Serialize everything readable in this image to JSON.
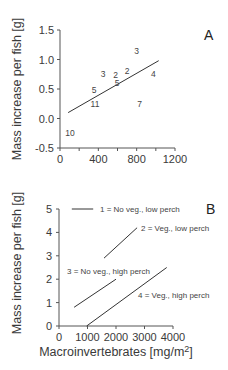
{
  "chart_data": [
    {
      "panel": "A",
      "type": "scatter",
      "title": "",
      "xlabel": "",
      "ylabel": "Mass increase per fish [g]",
      "xlim": [
        0,
        1200
      ],
      "ylim": [
        -0.5,
        1.5
      ],
      "xticks": [
        "0",
        "400",
        "800",
        "1200"
      ],
      "yticks": [
        "-0.5",
        "0.0",
        "0.5",
        "1.0",
        "1.5"
      ],
      "grid": false,
      "points": [
        {
          "label": "3",
          "x": 800,
          "y": 1.15
        },
        {
          "label": "3",
          "x": 450,
          "y": 0.76
        },
        {
          "label": "2",
          "x": 580,
          "y": 0.73
        },
        {
          "label": "2",
          "x": 700,
          "y": 0.81
        },
        {
          "label": "5",
          "x": 595,
          "y": 0.61
        },
        {
          "label": "4",
          "x": 975,
          "y": 0.76
        },
        {
          "label": "5",
          "x": 355,
          "y": 0.49
        },
        {
          "label": "11",
          "x": 365,
          "y": 0.25
        },
        {
          "label": "7",
          "x": 830,
          "y": 0.25
        },
        {
          "label": "10",
          "x": 105,
          "y": -0.25
        }
      ],
      "regression_line": {
        "x": [
          85,
          1030
        ],
        "y": [
          0.1,
          0.98
        ]
      }
    },
    {
      "panel": "B",
      "type": "line",
      "title": "",
      "xlabel": "Macroinvertebrates [mg/m²]",
      "ylabel": "Mass increase per fish [g]",
      "xlim": [
        0,
        4000
      ],
      "ylim": [
        0,
        5
      ],
      "xticks": [
        "0",
        "1000",
        "2000",
        "3000",
        "4000"
      ],
      "yticks": [
        "0",
        "1",
        "2",
        "3",
        "4",
        "5"
      ],
      "grid": false,
      "series": [
        {
          "name": "1 = No veg., low perch",
          "x": [
            450,
            1200
          ],
          "y": [
            5.0,
            5.0
          ],
          "legend_style": true
        },
        {
          "name": "2 = Veg., low perch",
          "x": [
            1580,
            2740
          ],
          "y": [
            2.9,
            4.2
          ]
        },
        {
          "name": "3 = No veg., high perch",
          "x": [
            530,
            2000
          ],
          "y": [
            0.8,
            2.0
          ]
        },
        {
          "name": "4 = Veg., high perch",
          "x": [
            970,
            3780
          ],
          "y": [
            0.0,
            2.5
          ]
        }
      ]
    }
  ],
  "labels": {
    "panelA": "A",
    "panelB": "B",
    "ylabelA": "Mass increase per fish [g]",
    "ylabelB": "Mass increase per fish [g]",
    "xlabelB_main": "Macroinvertebrates [mg/m",
    "xlabelB_sup": "2",
    "xlabelB_end": "]",
    "legend1": "1 = No veg., low perch",
    "legend2": "2 = Veg., low perch",
    "legend3": "3 = No veg., high perch",
    "legend4": "4 = Veg., high perch"
  }
}
